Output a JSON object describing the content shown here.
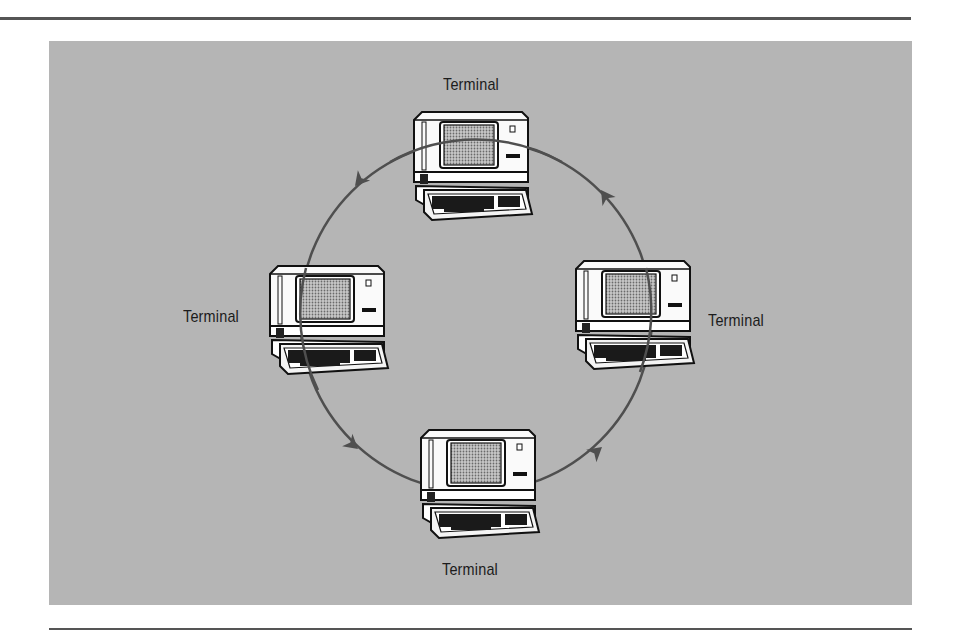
{
  "figure": {
    "type": "ring-network",
    "background_color": "#b5b5b5",
    "line_color": "#555555",
    "flow_direction": "counter-clockwise",
    "nodes": [
      {
        "position": "top",
        "label": "Terminal"
      },
      {
        "position": "left",
        "label": "Terminal"
      },
      {
        "position": "right",
        "label": "Terminal"
      },
      {
        "position": "bottom",
        "label": "Terminal"
      }
    ],
    "arrows": 4
  }
}
